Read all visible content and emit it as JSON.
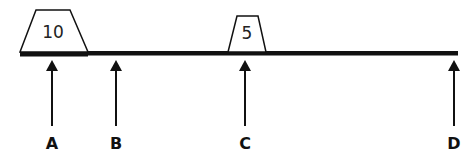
{
  "diagram": {
    "type": "beam-with-loads",
    "colors": {
      "stroke": "#111111",
      "background": "#ffffff"
    },
    "beam": {
      "x1": 20,
      "x2": 458,
      "y": 53
    },
    "blocks": [
      {
        "label": "10",
        "top_x1": 36,
        "top_x2": 70,
        "top_y": 10,
        "bottom_x1": 20,
        "bottom_x2": 88,
        "bottom_y": 52
      },
      {
        "label": "5",
        "top_x1": 237,
        "top_x2": 258,
        "top_y": 16,
        "bottom_x1": 228,
        "bottom_x2": 266,
        "bottom_y": 52
      }
    ],
    "points": [
      {
        "label": "A",
        "x": 52
      },
      {
        "label": "B",
        "x": 116
      },
      {
        "label": "C",
        "x": 245
      },
      {
        "label": "D",
        "x": 454
      }
    ]
  }
}
